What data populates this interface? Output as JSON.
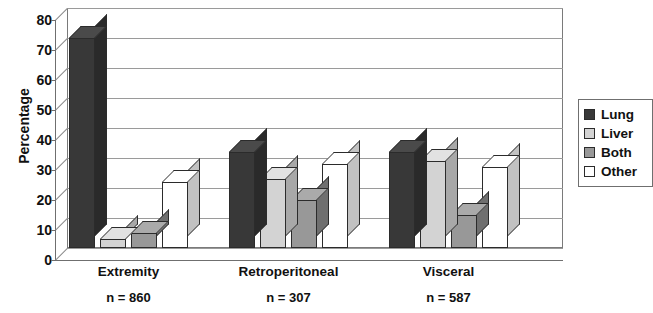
{
  "chart_data": {
    "type": "bar",
    "title": "",
    "xlabel": "",
    "ylabel": "Percentage",
    "ylim": [
      0,
      80
    ],
    "yticks": [
      0,
      10,
      20,
      30,
      40,
      50,
      60,
      70,
      80
    ],
    "grid": true,
    "legend_position": "right",
    "categories": [
      "Extremity",
      "Retroperitoneal",
      "Visceral"
    ],
    "category_sublabels": [
      "n = 860",
      "n = 307",
      "n = 587"
    ],
    "series": [
      {
        "name": "Lung",
        "color": "#383838",
        "values": [
          70,
          32,
          32
        ]
      },
      {
        "name": "Liver",
        "color": "#d3d3d3",
        "values": [
          3,
          23,
          29
        ]
      },
      {
        "name": "Both",
        "color": "#989898",
        "values": [
          5,
          16,
          11
        ]
      },
      {
        "name": "Other",
        "color": "#ffffff",
        "values": [
          22,
          28,
          27
        ]
      }
    ]
  },
  "legend": {
    "items": [
      {
        "label": "Lung"
      },
      {
        "label": "Liver"
      },
      {
        "label": "Both"
      },
      {
        "label": "Other"
      }
    ]
  }
}
